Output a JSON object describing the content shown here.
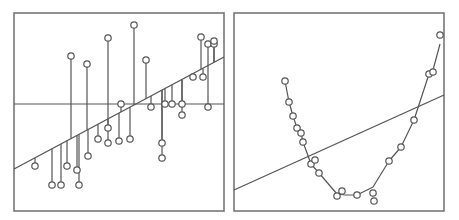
{
  "chart_data": [
    {
      "type": "scatter",
      "title": "",
      "xlabel": "",
      "ylabel": "",
      "grid": false,
      "legend": null,
      "description": "Linear regression fit with residual lines; horizontal mean line shown",
      "frame": {
        "x0": 14,
        "y0": 13,
        "x1": 224,
        "y1": 211
      },
      "mean_line_y": 104,
      "fit_line": [
        [
          14,
          169
        ],
        [
          224,
          57
        ]
      ],
      "points": [
        [
          35,
          166
        ],
        [
          52,
          185
        ],
        [
          61,
          185
        ],
        [
          67,
          166
        ],
        [
          71,
          56
        ],
        [
          77,
          170
        ],
        [
          79,
          185
        ],
        [
          88,
          156
        ],
        [
          87,
          64
        ],
        [
          98,
          139
        ],
        [
          108,
          128
        ],
        [
          108,
          143
        ],
        [
          108,
          38
        ],
        [
          119,
          141
        ],
        [
          121,
          104
        ],
        [
          130,
          139
        ],
        [
          134,
          25
        ],
        [
          146,
          60
        ],
        [
          151,
          107
        ],
        [
          162,
          143
        ],
        [
          162,
          158
        ],
        [
          165,
          104
        ],
        [
          172,
          104
        ],
        [
          182,
          104
        ],
        [
          182,
          115
        ],
        [
          193,
          77
        ],
        [
          201,
          37
        ],
        [
          203,
          77
        ],
        [
          208,
          44
        ],
        [
          208,
          107
        ],
        [
          214,
          44
        ],
        [
          214,
          41
        ]
      ]
    },
    {
      "type": "scatter",
      "title": "",
      "xlabel": "",
      "ylabel": "",
      "grid": false,
      "legend": null,
      "description": "U-shaped data with a poor linear fit and a smooth curve fit",
      "frame": {
        "x0": 234,
        "y0": 13,
        "x1": 444,
        "y1": 211
      },
      "fit_line": [
        [
          234,
          190
        ],
        [
          444,
          95
        ]
      ],
      "curve": [
        [
          285,
          81
        ],
        [
          289,
          102
        ],
        [
          293,
          116
        ],
        [
          297,
          128
        ],
        [
          301,
          133
        ],
        [
          303,
          142
        ],
        [
          311,
          164
        ],
        [
          319,
          173
        ],
        [
          337,
          194
        ],
        [
          345,
          195
        ],
        [
          357,
          195
        ],
        [
          373,
          187
        ],
        [
          389,
          161
        ],
        [
          401,
          147
        ],
        [
          414,
          120
        ],
        [
          429,
          74
        ],
        [
          433,
          70
        ],
        [
          440,
          44
        ]
      ],
      "points": [
        [
          285,
          81
        ],
        [
          289,
          102
        ],
        [
          293,
          116
        ],
        [
          297,
          128
        ],
        [
          301,
          133
        ],
        [
          303,
          142
        ],
        [
          311,
          164
        ],
        [
          315,
          160
        ],
        [
          319,
          173
        ],
        [
          337,
          196
        ],
        [
          342,
          191
        ],
        [
          357,
          195
        ],
        [
          373,
          193
        ],
        [
          374,
          201
        ],
        [
          389,
          161
        ],
        [
          401,
          147
        ],
        [
          414,
          120
        ],
        [
          429,
          74
        ],
        [
          433,
          72
        ],
        [
          440,
          35
        ]
      ]
    }
  ],
  "style": {
    "stroke": "#555555",
    "frame_stroke": "#777777",
    "marker_fill": "#ffffff",
    "background": "#ffffff"
  }
}
